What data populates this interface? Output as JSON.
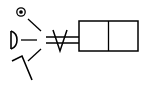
{
  "diagram": {
    "type": "valve-symbol",
    "actuators": [
      {
        "name": "rotary-knob",
        "icon": "circle-dot-icon"
      },
      {
        "name": "pushbutton",
        "icon": "pushbutton-icon"
      },
      {
        "name": "lever",
        "icon": "lever-icon"
      }
    ],
    "connection": "double-line-with-v-detent",
    "valve": {
      "positions": 2
    },
    "colors": {
      "stroke": "#000000",
      "background": "#ffffff"
    }
  }
}
